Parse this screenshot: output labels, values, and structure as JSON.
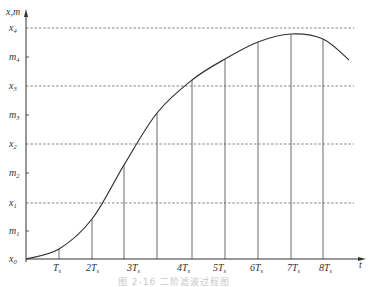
{
  "figure": {
    "y_axis_label": "x,m",
    "x_axis_label": "t",
    "caption": "图 2-16  二阶滤波过程图",
    "y_ticks": [
      {
        "name": "x0",
        "base": "x",
        "sub": "0",
        "y": 259,
        "dashed": false
      },
      {
        "name": "m1",
        "base": "m",
        "sub": "1",
        "y": 231,
        "dashed": false
      },
      {
        "name": "x1",
        "base": "x",
        "sub": "1",
        "y": 203,
        "dashed": true
      },
      {
        "name": "m2",
        "base": "m",
        "sub": "2",
        "y": 173,
        "dashed": false
      },
      {
        "name": "x2",
        "base": "x",
        "sub": "2",
        "y": 144,
        "dashed": true
      },
      {
        "name": "m3",
        "base": "m",
        "sub": "3",
        "y": 115,
        "dashed": false
      },
      {
        "name": "x3",
        "base": "x",
        "sub": "3",
        "y": 86,
        "dashed": true
      },
      {
        "name": "m4",
        "base": "m",
        "sub": "4",
        "y": 57,
        "dashed": false
      },
      {
        "name": "x4",
        "base": "x",
        "sub": "4",
        "y": 28,
        "dashed": true
      }
    ],
    "x_ticks": [
      {
        "label": "T",
        "coef": "",
        "x": 59
      },
      {
        "label": "T",
        "coef": "2",
        "x": 92
      },
      {
        "label": "T",
        "coef": "3",
        "x": 133
      },
      {
        "label": "T",
        "coef": "4",
        "x": 183
      },
      {
        "label": "T",
        "coef": "5",
        "x": 219
      },
      {
        "label": "T",
        "coef": "6",
        "x": 256
      },
      {
        "label": "T",
        "coef": "7",
        "x": 293
      },
      {
        "label": "T",
        "coef": "8",
        "x": 325
      }
    ],
    "x_tick_subscript": "s",
    "verticals": [
      {
        "x": 59,
        "top": 249
      },
      {
        "x": 92,
        "top": 219
      },
      {
        "x": 124,
        "top": 165
      },
      {
        "x": 157,
        "top": 113
      },
      {
        "x": 192,
        "top": 80
      },
      {
        "x": 225,
        "top": 59
      },
      {
        "x": 258,
        "top": 42
      },
      {
        "x": 291,
        "top": 34
      },
      {
        "x": 323,
        "top": 39
      }
    ],
    "curve_points": [
      [
        26,
        259
      ],
      [
        59,
        249
      ],
      [
        92,
        219
      ],
      [
        124,
        165
      ],
      [
        157,
        113
      ],
      [
        192,
        80
      ],
      [
        225,
        59
      ],
      [
        258,
        42
      ],
      [
        291,
        34
      ],
      [
        323,
        39
      ],
      [
        349,
        60
      ]
    ],
    "colors": {
      "line": "#333333",
      "grid": "#555555",
      "caption": "#c8c8c8"
    }
  }
}
